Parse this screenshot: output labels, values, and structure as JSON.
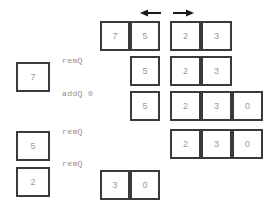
{
  "diagram": {
    "colors": {
      "border": "#3a3a3a",
      "digit": "#9a9a9a",
      "label": "#8e8e8e",
      "background": "#ffffff",
      "arrow": "#1a1a1a"
    },
    "arrows": [
      {
        "name": "left-arrow",
        "direction": "left",
        "x": 140,
        "y": 8,
        "width": 22,
        "height": 10
      },
      {
        "name": "right-arrow",
        "direction": "right",
        "x": 172,
        "y": 8,
        "width": 22,
        "height": 10
      }
    ],
    "op_labels": [
      {
        "id": "op1",
        "text": "remQ",
        "x": 62,
        "y": 57
      },
      {
        "id": "op2",
        "text": "addQ 0",
        "x": 62,
        "y": 90
      },
      {
        "id": "op3",
        "text": "remQ",
        "x": 62,
        "y": 128
      },
      {
        "id": "op4",
        "text": "remQ",
        "x": 62,
        "y": 160
      }
    ],
    "removed_items": [
      {
        "id": "rem-7",
        "value": "7",
        "x": 16,
        "y": 62,
        "w": 34,
        "h": 30
      },
      {
        "id": "rem-5",
        "value": "5",
        "x": 16,
        "y": 131,
        "w": 34,
        "h": 30
      },
      {
        "id": "rem-2",
        "value": "2",
        "x": 16,
        "y": 167,
        "w": 34,
        "h": 30
      }
    ],
    "rows": [
      {
        "id": "row-1",
        "y": 21,
        "h": 30,
        "left_group": {
          "x": 100,
          "cell_w": 30,
          "values": [
            "7",
            "5"
          ]
        },
        "right_group": {
          "x": 170,
          "cell_w": 31,
          "values": [
            "2",
            "3"
          ]
        }
      },
      {
        "id": "row-2",
        "y": 56,
        "h": 30,
        "left_group": {
          "x": 130,
          "cell_w": 30,
          "values": [
            "5"
          ]
        },
        "right_group": {
          "x": 170,
          "cell_w": 31,
          "values": [
            "2",
            "3"
          ]
        }
      },
      {
        "id": "row-3",
        "y": 91,
        "h": 30,
        "left_group": {
          "x": 130,
          "cell_w": 30,
          "values": [
            "5"
          ]
        },
        "right_group": {
          "x": 170,
          "cell_w": 31,
          "values": [
            "2",
            "3",
            "0"
          ]
        }
      },
      {
        "id": "row-4",
        "y": 129,
        "h": 30,
        "left_group": null,
        "right_group": {
          "x": 170,
          "cell_w": 31,
          "values": [
            "2",
            "3",
            "0"
          ]
        }
      },
      {
        "id": "row-5",
        "y": 170,
        "h": 30,
        "left_group": {
          "x": 100,
          "cell_w": 30,
          "values": [
            "3",
            "0"
          ]
        },
        "right_group": null
      }
    ]
  }
}
